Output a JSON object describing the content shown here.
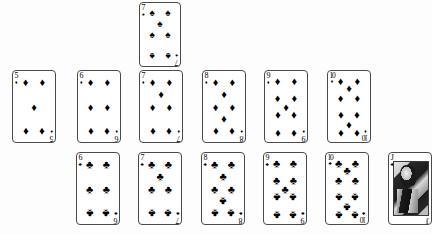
{
  "scene": {
    "description": "Playing card spread on white background",
    "background_color": "#fdfdfd",
    "ink_color": "#111111",
    "card_border_color": "#4a4a4a"
  },
  "suit_glyphs": {
    "spade": "♠",
    "heart": "♥",
    "diamond": "♦",
    "club": "♣"
  },
  "rows": [
    {
      "name": "top-row",
      "cards": [
        {
          "rank": "7",
          "suit": "spade",
          "suit_name": "spades",
          "label": "7 of spades",
          "x": 139,
          "y": 2,
          "w": 42,
          "h": 65
        }
      ]
    },
    {
      "name": "diamond-row",
      "cards": [
        {
          "rank": "5",
          "suit": "diamond",
          "suit_name": "diamonds",
          "label": "5 of diamonds",
          "x": 12,
          "y": 70,
          "w": 44,
          "h": 73
        },
        {
          "rank": "6",
          "suit": "diamond",
          "suit_name": "diamonds",
          "label": "6 of diamonds",
          "x": 77,
          "y": 70,
          "w": 44,
          "h": 73
        },
        {
          "rank": "7",
          "suit": "diamond",
          "suit_name": "diamonds",
          "label": "7 of diamonds",
          "x": 139,
          "y": 70,
          "w": 44,
          "h": 73
        },
        {
          "rank": "8",
          "suit": "diamond",
          "suit_name": "diamonds",
          "label": "8 of diamonds",
          "x": 202,
          "y": 70,
          "w": 44,
          "h": 73
        },
        {
          "rank": "9",
          "suit": "diamond",
          "suit_name": "diamonds",
          "label": "9 of diamonds",
          "x": 264,
          "y": 70,
          "w": 44,
          "h": 73
        },
        {
          "rank": "10",
          "suit": "diamond",
          "suit_name": "diamonds",
          "label": "10 of diamonds",
          "x": 327,
          "y": 70,
          "w": 44,
          "h": 73
        }
      ]
    },
    {
      "name": "club-row",
      "cards": [
        {
          "rank": "6",
          "suit": "club",
          "suit_name": "clubs",
          "label": "6 of clubs",
          "x": 76,
          "y": 152,
          "w": 44,
          "h": 73
        },
        {
          "rank": "7",
          "suit": "club",
          "suit_name": "clubs",
          "label": "7 of clubs",
          "x": 138,
          "y": 152,
          "w": 44,
          "h": 73
        },
        {
          "rank": "8",
          "suit": "club",
          "suit_name": "clubs",
          "label": "8 of clubs",
          "x": 201,
          "y": 152,
          "w": 44,
          "h": 73
        },
        {
          "rank": "9",
          "suit": "club",
          "suit_name": "clubs",
          "label": "9 of clubs",
          "x": 263,
          "y": 152,
          "w": 44,
          "h": 73
        },
        {
          "rank": "10",
          "suit": "club",
          "suit_name": "clubs",
          "label": "10 of clubs",
          "x": 325,
          "y": 152,
          "w": 44,
          "h": 73
        },
        {
          "rank": "J",
          "suit": "club",
          "suit_name": "clubs",
          "label": "Jack of clubs",
          "face": true,
          "x": 388,
          "y": 152,
          "w": 44,
          "h": 73
        }
      ]
    }
  ]
}
